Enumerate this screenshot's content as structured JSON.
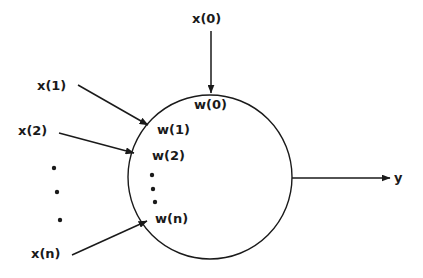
{
  "diagram": {
    "type": "neuron-schematic",
    "background_color": "#ffffff",
    "stroke_color": "#1a1a1a",
    "text_color": "#1a1a1a",
    "body": {
      "shape": "circle",
      "center_x": 210,
      "center_y": 177,
      "radius": 82
    },
    "inputs": [
      {
        "id": "x0",
        "label": "x(0)",
        "weight_label": "w(0)",
        "label_x": 192,
        "label_y": 12,
        "weight_x": 194,
        "weight_y": 98,
        "arrow": {
          "x1": 211,
          "y1": 31,
          "x2": 211,
          "y2": 93
        }
      },
      {
        "id": "x1",
        "label": "x(1)",
        "weight_label": "w(1)",
        "label_x": 37,
        "label_y": 79,
        "weight_x": 157,
        "weight_y": 123,
        "arrow": {
          "x1": 78,
          "y1": 85,
          "x2": 148,
          "y2": 125
        }
      },
      {
        "id": "x2",
        "label": "x(2)",
        "weight_label": "w(2)",
        "label_x": 18,
        "label_y": 124,
        "weight_x": 152,
        "weight_y": 149,
        "arrow": {
          "x1": 59,
          "y1": 133,
          "x2": 134,
          "y2": 153
        }
      },
      {
        "id": "xn",
        "label": "x(n)",
        "weight_label": "w(n)",
        "label_x": 31,
        "label_y": 247,
        "weight_x": 155,
        "weight_y": 212,
        "arrow": {
          "x1": 72,
          "y1": 255,
          "x2": 147,
          "y2": 221
        }
      }
    ],
    "ellipsis_outer": [
      {
        "cx": 54,
        "cy": 168,
        "r": 2.2
      },
      {
        "cx": 57,
        "cy": 192,
        "r": 2.2
      },
      {
        "cx": 60,
        "cy": 220,
        "r": 2.2
      }
    ],
    "ellipsis_inner": [
      {
        "cx": 152,
        "cy": 175,
        "r": 2.2
      },
      {
        "cx": 153,
        "cy": 189,
        "r": 2.2
      },
      {
        "cx": 155,
        "cy": 202,
        "r": 2.2
      }
    ],
    "output": {
      "label": "y",
      "label_x": 394,
      "label_y": 171,
      "arrow": {
        "x1": 292,
        "y1": 178,
        "x2": 390,
        "y2": 178
      }
    }
  }
}
